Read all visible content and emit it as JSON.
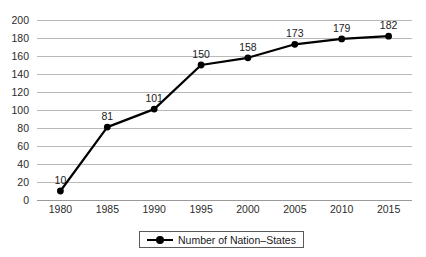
{
  "chart_data": {
    "type": "line",
    "title": "",
    "xlabel": "",
    "ylabel": "",
    "categories": [
      "1980",
      "1985",
      "1990",
      "1995",
      "2000",
      "2005",
      "2010",
      "2015"
    ],
    "series": [
      {
        "name": "Number of Nation–States",
        "values": [
          10,
          81,
          101,
          150,
          158,
          173,
          179,
          182
        ],
        "color": "#000000",
        "marker": "circle",
        "show_data_labels": true
      }
    ],
    "ylim": [
      0,
      200
    ],
    "ytick_step": 20,
    "ytick_labels": [
      "0",
      "20",
      "40",
      "60",
      "80",
      "100",
      "120",
      "140",
      "160",
      "180",
      "200"
    ],
    "xtick_labels": [
      "1980",
      "1985",
      "1990",
      "1995",
      "2000",
      "2005",
      "2010",
      "2015"
    ],
    "data_labels": [
      "10",
      "81",
      "101",
      "150",
      "158",
      "173",
      "179",
      "182"
    ],
    "grid": {
      "horizontal": true,
      "vertical": false,
      "color": "#b9b9b9"
    },
    "legend": {
      "position": "bottom-center",
      "bordered": true,
      "entries": [
        {
          "label": "Number of Nation–States",
          "color": "#000000",
          "marker": "circle"
        }
      ]
    },
    "background": "#ffffff",
    "axis_color": "#9a9a9a",
    "text_color": "#1a1a1a"
  },
  "legend": {
    "entry_label": "Number of Nation–States"
  }
}
